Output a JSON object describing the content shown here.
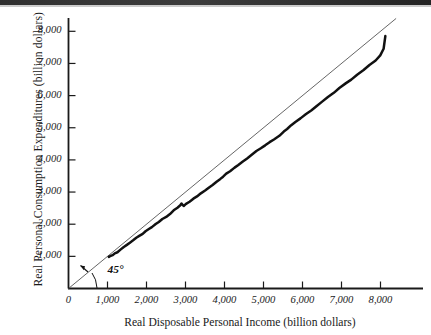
{
  "figure": {
    "name": "consumption-function-scatter",
    "background": "#ffffff",
    "ink_color": "#1a1a1a",
    "fortyfive_line_color": "#555555",
    "data_line_color": "#111111"
  },
  "chart_data": {
    "type": "line",
    "title": "",
    "subtitle": "",
    "xlabel": "Real Disposable Personal Income (billion dollars)",
    "ylabel": "Real Personal Consumption Expenditures (billion dollars)",
    "xlim": [
      0,
      8400
    ],
    "ylim": [
      0,
      8450
    ],
    "grid": false,
    "legend": null,
    "legend_position": "none",
    "xticks": [
      0,
      1000,
      2000,
      3000,
      4000,
      5000,
      6000,
      7000,
      8000
    ],
    "xtick_labels": [
      "0",
      "1,000",
      "2,000",
      "3,000",
      "4,000",
      "5,000",
      "6,000",
      "7,000",
      "8,000"
    ],
    "yticks": [
      1000,
      2000,
      3000,
      4000,
      5000,
      6000,
      7000,
      8000
    ],
    "ytick_labels": [
      "1,000",
      "2,000",
      "3,000",
      "4,000",
      "5,000",
      "6,000",
      "7,000",
      "8,000"
    ],
    "annotations": [
      {
        "text": "45°",
        "x": 950,
        "y": 520,
        "points_to": "forty-five-degree-reference-line"
      }
    ],
    "series": [
      {
        "name": "45-degree reference line",
        "style": "thin straight line",
        "x": [
          0,
          8400
        ],
        "values": [
          0,
          8400
        ]
      },
      {
        "name": "Real consumption vs real disposable income",
        "style": "thick jagged time-series path",
        "x": [
          1030,
          1080,
          1130,
          1190,
          1250,
          1330,
          1420,
          1500,
          1580,
          1660,
          1740,
          1820,
          1900,
          1980,
          2060,
          2140,
          2230,
          2320,
          2410,
          2500,
          2600,
          2700,
          2800,
          2870,
          2900,
          2950,
          3020,
          3110,
          3200,
          3300,
          3400,
          3500,
          3600,
          3700,
          3800,
          3880,
          3960,
          4050,
          4150,
          4260,
          4360,
          4470,
          4580,
          4700,
          4820,
          4930,
          5040,
          5150,
          5270,
          5400,
          5520,
          5600,
          5700,
          5820,
          5950,
          6080,
          6220,
          6360,
          6500,
          6650,
          6800,
          6950,
          7100,
          7250,
          7400,
          7560,
          7720,
          7880,
          8000,
          8080,
          8120
        ],
        "values": [
          980,
          1010,
          1040,
          1090,
          1140,
          1210,
          1290,
          1360,
          1430,
          1500,
          1570,
          1640,
          1710,
          1780,
          1850,
          1920,
          2000,
          2080,
          2160,
          2240,
          2330,
          2420,
          2510,
          2600,
          2640,
          2560,
          2620,
          2700,
          2780,
          2870,
          2960,
          3050,
          3140,
          3230,
          3320,
          3400,
          3480,
          3560,
          3660,
          3760,
          3850,
          3950,
          4050,
          4160,
          4270,
          4360,
          4450,
          4540,
          4640,
          4760,
          4870,
          4950,
          5060,
          5180,
          5300,
          5420,
          5550,
          5680,
          5810,
          5950,
          6090,
          6230,
          6370,
          6510,
          6650,
          6800,
          6950,
          7100,
          7240,
          7450,
          7840
        ]
      }
    ]
  }
}
